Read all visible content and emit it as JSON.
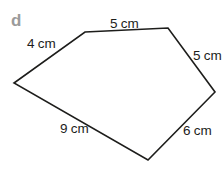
{
  "figure": {
    "item_label": "d",
    "shape": "irregular pentagon",
    "polygon_points": "85,32 168,28 215,92 148,160 14,83",
    "sides": [
      {
        "position": "top",
        "label": "5 cm",
        "value_cm": 5
      },
      {
        "position": "upper-left",
        "label": "4 cm",
        "value_cm": 4
      },
      {
        "position": "upper-right",
        "label": "5 cm",
        "value_cm": 5
      },
      {
        "position": "bottom-left",
        "label": "9 cm",
        "value_cm": 9
      },
      {
        "position": "lower-right",
        "label": "6 cm",
        "value_cm": 6
      }
    ],
    "colors": {
      "outline": "#1d1d1b",
      "label_text": "#1d1d1b",
      "item_label": "#9b9b9b",
      "background": "#ffffff"
    }
  }
}
